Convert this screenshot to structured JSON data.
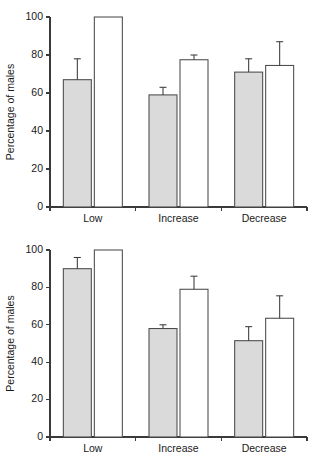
{
  "figure": {
    "title": "",
    "panels": [
      {
        "id": "top",
        "ylabel": "Percentage of males"
      },
      {
        "id": "bottom",
        "ylabel": "Percentage of males"
      }
    ]
  },
  "chart_data": [
    {
      "type": "bar",
      "title": "",
      "xlabel": "",
      "ylabel": "Percentage of males",
      "ylim": [
        0,
        100
      ],
      "yticks": [
        0,
        20,
        40,
        60,
        80,
        100
      ],
      "ytick_labels": [
        "0",
        "20",
        "40",
        "60",
        "80",
        "100"
      ],
      "categories": [
        "Low",
        "Increase",
        "Decrease"
      ],
      "grid": false,
      "legend": "none",
      "series": [
        {
          "name": "grey",
          "fill": "#dadada",
          "values": [
            67,
            59,
            71
          ],
          "errors_upper": [
            78,
            63,
            78
          ],
          "errors_lower": [
            67,
            59,
            71
          ]
        },
        {
          "name": "white",
          "fill": "#ffffff",
          "values": [
            100,
            77.5,
            74.5
          ],
          "errors_upper": [
            100,
            80,
            87
          ],
          "errors_lower": [
            100,
            77.5,
            74.5
          ]
        }
      ]
    },
    {
      "type": "bar",
      "title": "",
      "xlabel": "",
      "ylabel": "Percentage of males",
      "ylim": [
        0,
        100
      ],
      "yticks": [
        0,
        20,
        40,
        60,
        80,
        100
      ],
      "ytick_labels": [
        "0",
        "20",
        "40",
        "60",
        "80",
        "100"
      ],
      "categories": [
        "Low",
        "Increase",
        "Decrease"
      ],
      "grid": false,
      "legend": "none",
      "series": [
        {
          "name": "grey",
          "fill": "#dadada",
          "values": [
            90,
            58,
            51.5
          ],
          "errors_upper": [
            96,
            60,
            59
          ],
          "errors_lower": [
            90,
            58,
            51.5
          ]
        },
        {
          "name": "white",
          "fill": "#ffffff",
          "values": [
            100,
            79,
            63.5
          ],
          "errors_upper": [
            100,
            86,
            75.5
          ],
          "errors_lower": [
            100,
            79,
            63.5
          ]
        }
      ]
    }
  ]
}
